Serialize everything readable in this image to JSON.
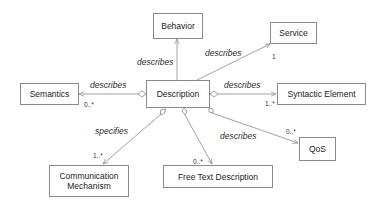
{
  "diagram": {
    "type": "uml-class-diagram",
    "classes": {
      "behavior": "Behavior",
      "service": "Service",
      "semantics": "Semantics",
      "description": "Description",
      "syntactic_element": "Syntactic Element",
      "qos": "QoS",
      "communication_mechanism_line1": "Communication",
      "communication_mechanism_line2": "Mechanism",
      "free_text_description": "Free Text Description"
    },
    "associations": [
      {
        "from": "Description",
        "to": "Behavior",
        "label": "describes",
        "multiplicity": ""
      },
      {
        "from": "Description",
        "to": "Service",
        "label": "describes",
        "multiplicity": "1"
      },
      {
        "from": "Description",
        "to": "Semantics",
        "label": "describes",
        "multiplicity": "0..*"
      },
      {
        "from": "Description",
        "to": "Syntactic Element",
        "label": "describes",
        "multiplicity": "1..*"
      },
      {
        "from": "Description",
        "to": "QoS",
        "label": "describes",
        "multiplicity": "0..*"
      },
      {
        "from": "Description",
        "to": "Communication Mechanism",
        "label": "specifies",
        "multiplicity": "1..*"
      },
      {
        "from": "Description",
        "to": "Free Text Description",
        "label": "",
        "multiplicity": "0..*"
      }
    ],
    "colors": {
      "line": "#8a8a8a",
      "box_border": "#8a8a8a",
      "background": "#ffffff",
      "text": "#222222"
    }
  }
}
